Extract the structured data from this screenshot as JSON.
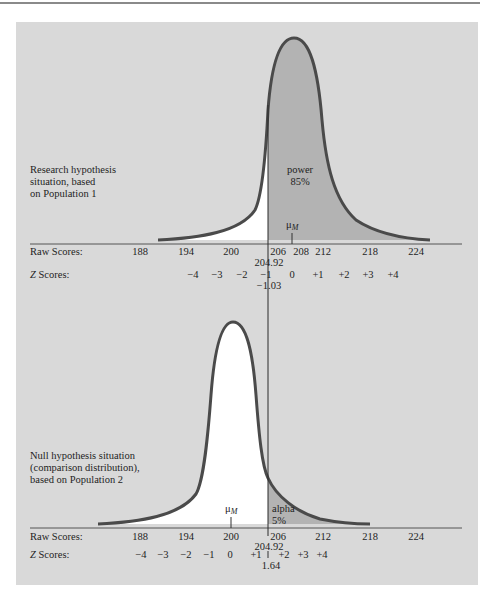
{
  "figure": {
    "top_panel": {
      "description_lines": [
        "Research hypothesis",
        "situation, based",
        "on Population 1"
      ],
      "shaded_region_label": [
        "power",
        "85%"
      ],
      "mean_label": "μ",
      "mean_subscript": "M",
      "raw_scores_label": "Raw Scores:",
      "z_scores_label_italic": "Z",
      "z_scores_label_rest": " Scores:",
      "raw_ticks": [
        "188",
        "194",
        "200",
        "206",
        "208",
        "212",
        "218",
        "224"
      ],
      "cutoff_raw": "204.92",
      "z_ticks": [
        "−4",
        "−3",
        "−2",
        "−1",
        "0",
        "+1",
        "+2",
        "+3",
        "+4"
      ],
      "cutoff_z": "−1.03"
    },
    "bottom_panel": {
      "description_lines": [
        "Null hypothesis situation",
        "(comparison distribution),",
        "based on Population 2"
      ],
      "shaded_region_label": [
        "alpha",
        "5%"
      ],
      "mean_label": "μ",
      "mean_subscript": "M",
      "raw_scores_label": "Raw Scores:",
      "z_scores_label_italic": "Z",
      "z_scores_label_rest": " Scores:",
      "raw_ticks": [
        "188",
        "194",
        "200",
        "206",
        "212",
        "218",
        "224"
      ],
      "cutoff_raw": "204.92",
      "z_ticks": [
        "−4",
        "−3",
        "−2",
        "−1",
        "0",
        "+1",
        "+2",
        "+3",
        "+4"
      ],
      "cutoff_z": "1.64"
    },
    "colors": {
      "panel_background": "#d9d9d9",
      "shaded_area": "#b3b3b3",
      "unshaded_area": "#ffffff",
      "curve_stroke": "#4a4a4a"
    }
  }
}
